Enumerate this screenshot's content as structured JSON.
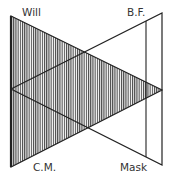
{
  "diagram": {
    "labels": {
      "will": "Will",
      "bf": "B.F.",
      "cm": "C.M.",
      "mask": "Mask"
    },
    "colors": {
      "stroke": "#222222",
      "hatch": "#444444",
      "background": "#ffffff",
      "text": "#333333"
    },
    "shapes": {
      "hatched_triangle": [
        [
          11,
          16
        ],
        [
          162,
          90
        ],
        [
          11,
          167
        ]
      ],
      "outline_triangle": [
        [
          11,
          89
        ],
        [
          162,
          13
        ],
        [
          162,
          165
        ]
      ],
      "inner_vertical_line": [
        [
          146,
          21
        ],
        [
          146,
          157
        ]
      ]
    }
  }
}
